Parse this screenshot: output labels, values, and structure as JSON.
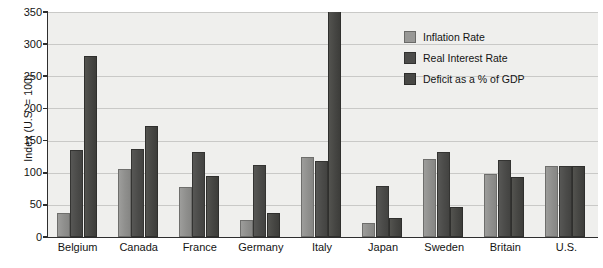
{
  "chart_data": {
    "type": "bar",
    "title": "",
    "xlabel": "",
    "ylabel": "Index (U.S. = 100)",
    "ylim": [
      0,
      350
    ],
    "ytick_labels": [
      "350",
      "300",
      "250",
      "200",
      "150",
      "100",
      "50",
      "0"
    ],
    "yticks": [
      350,
      300,
      250,
      200,
      150,
      100,
      50,
      0
    ],
    "grid": true,
    "legend_position": "upper-right",
    "categories": [
      "Belgium",
      "Canada",
      "France",
      "Germany",
      "Italy",
      "Japan",
      "Sweden",
      "Britain",
      "U.S."
    ],
    "series": [
      {
        "name": "Inflation Rate",
        "color": "#989896",
        "values": [
          37,
          106,
          78,
          27,
          125,
          22,
          122,
          98,
          110
        ]
      },
      {
        "name": "Real Interest Rate",
        "color": "#4c4c4a",
        "values": [
          135,
          137,
          132,
          112,
          118,
          80,
          133,
          120,
          110
        ]
      },
      {
        "name": "Deficit as a % of GDP",
        "color": "#484845",
        "values": [
          281,
          173,
          95,
          38,
          352,
          30,
          47,
          93,
          110
        ]
      }
    ]
  },
  "legend": {
    "items": [
      {
        "label": "Inflation Rate"
      },
      {
        "label": "Real Interest Rate"
      },
      {
        "label": "Deficit as a % of GDP"
      }
    ]
  }
}
